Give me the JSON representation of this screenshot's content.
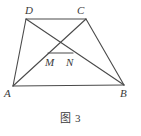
{
  "figure": {
    "caption": "图 3",
    "caption_x": 70,
    "caption_y": 113,
    "width": 141,
    "height": 136,
    "background_color": "#ffffff",
    "stroke_color": "#4a4a4a",
    "label_color": "#3a3a3a",
    "stroke_width": 1.1
  },
  "geometry": {
    "points": {
      "A": {
        "x": 13,
        "y": 86
      },
      "B": {
        "x": 124,
        "y": 85
      },
      "C": {
        "x": 86,
        "y": 19
      },
      "D": {
        "x": 26,
        "y": 19
      },
      "M": {
        "x": 48,
        "y": 53
      },
      "N": {
        "x": 73,
        "y": 53
      }
    },
    "segments": [
      {
        "name": "AD",
        "from": "A",
        "to": "D"
      },
      {
        "name": "DC",
        "from": "D",
        "to": "C"
      },
      {
        "name": "CB",
        "from": "C",
        "to": "B"
      },
      {
        "name": "AB",
        "from": "A",
        "to": "B"
      },
      {
        "name": "DB",
        "from": "D",
        "to": "B"
      },
      {
        "name": "AC",
        "from": "A",
        "to": "C"
      },
      {
        "name": "MN",
        "from": "M",
        "to": "N"
      }
    ]
  },
  "labels": {
    "A": {
      "text": "A",
      "x": 4,
      "y": 88
    },
    "B": {
      "text": "B",
      "x": 120,
      "y": 88
    },
    "C": {
      "text": "C",
      "x": 77,
      "y": 5
    },
    "D": {
      "text": "D",
      "x": 25,
      "y": 5
    },
    "M": {
      "text": "M",
      "x": 45,
      "y": 57
    },
    "N": {
      "text": "N",
      "x": 66,
      "y": 57
    }
  }
}
